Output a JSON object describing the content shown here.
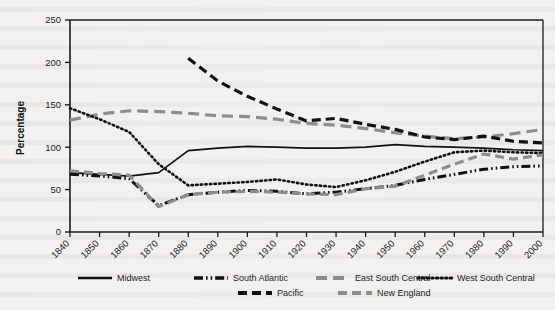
{
  "chart_data": {
    "type": "line",
    "title": "",
    "xlabel": "",
    "ylabel": "Percentage",
    "ylim": [
      0,
      250
    ],
    "yticks": [
      0,
      50,
      100,
      150,
      200,
      250
    ],
    "grid": false,
    "legend_position": "bottom",
    "x": [
      1840,
      1850,
      1860,
      1870,
      1880,
      1890,
      1900,
      1910,
      1920,
      1930,
      1940,
      1950,
      1960,
      1970,
      1980,
      1990,
      2000
    ],
    "categories": [
      "1840",
      "1850",
      "1860",
      "1870",
      "1880",
      "1890",
      "1900",
      "1910",
      "1920",
      "1930",
      "1940",
      "1950",
      "1960",
      "1970",
      "1980",
      "1990",
      "2000"
    ],
    "series": [
      {
        "name": "Midwest",
        "style": "solid",
        "color": "#111111",
        "values": [
          70,
          68,
          66,
          70,
          96,
          99,
          101,
          100,
          99,
          99,
          100,
          103,
          101,
          100,
          99,
          97,
          96
        ]
      },
      {
        "name": "South Atlantic",
        "style": "dash-dot-dot",
        "color": "#111111",
        "values": [
          68,
          66,
          63,
          31,
          44,
          47,
          49,
          48,
          45,
          47,
          51,
          55,
          62,
          68,
          74,
          77,
          78
        ]
      },
      {
        "name": "East South Central",
        "style": "long-dash",
        "color": "#8d8d8d",
        "values": [
          132,
          139,
          143,
          142,
          140,
          137,
          136,
          133,
          128,
          126,
          122,
          117,
          113,
          110,
          112,
          116,
          121
        ]
      },
      {
        "name": "West South Central",
        "style": "dotted",
        "color": "#111111",
        "values": [
          146,
          133,
          118,
          80,
          55,
          57,
          59,
          62,
          56,
          53,
          61,
          71,
          83,
          94,
          96,
          94,
          93
        ]
      },
      {
        "name": "Pacific",
        "style": "dash",
        "color": "#111111",
        "values": [
          null,
          null,
          null,
          null,
          205,
          178,
          160,
          145,
          131,
          134,
          127,
          121,
          112,
          109,
          113,
          107,
          105
        ]
      },
      {
        "name": "New England",
        "style": "dash",
        "color": "#8d8d8d",
        "values": [
          72,
          69,
          67,
          30,
          44,
          47,
          48,
          47,
          45,
          44,
          51,
          54,
          67,
          80,
          92,
          86,
          91
        ]
      }
    ]
  },
  "legend": {
    "items": [
      {
        "label": "Midwest"
      },
      {
        "label": "South Atlantic"
      },
      {
        "label": "East South Central"
      },
      {
        "label": "West South Central"
      },
      {
        "label": "Pacific"
      },
      {
        "label": "New England"
      }
    ]
  }
}
